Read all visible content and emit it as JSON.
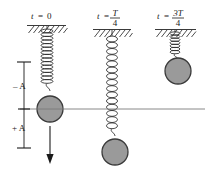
{
  "figure": {
    "background_color": "#ffffff",
    "line_color": "#3a3a3a",
    "ball_fill": "#9a9a9a",
    "ball_stroke": "#3a3a3a",
    "spring_color": "#2b2b2b",
    "text_color": "#1a1a1a"
  },
  "panels": [
    {
      "id": "panel-t0",
      "time_label_prefix": "t",
      "time_label_equals": "=",
      "time_label_value": "0",
      "time_label_numerator": "",
      "time_label_denominator": "",
      "spring_state": "compressed-at-top",
      "ball_position": "equilibrium",
      "arrow": "down"
    },
    {
      "id": "panel-tT4",
      "time_label_prefix": "t",
      "time_label_equals": "=",
      "time_label_value": "",
      "time_label_numerator": "T",
      "time_label_denominator": "4",
      "spring_state": "stretched",
      "ball_position": "plus-A",
      "arrow": "none"
    },
    {
      "id": "panel-t3T4",
      "time_label_prefix": "t",
      "time_label_equals": "=",
      "time_label_value": "",
      "time_label_numerator": "3T",
      "time_label_denominator": "4",
      "spring_state": "compressed",
      "ball_position": "minus-A",
      "arrow": "none"
    }
  ],
  "amplitude_axis": {
    "upper_label": "– A",
    "lower_label": "+ A",
    "name": "amplitude-scale"
  },
  "equilibrium_line": {
    "name": "equilibrium-axis",
    "label": ""
  }
}
